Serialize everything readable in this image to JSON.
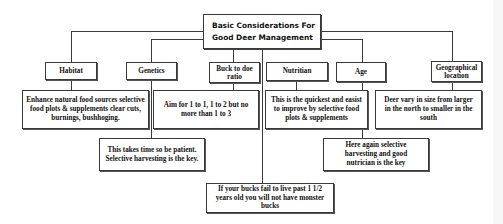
{
  "diagram": {
    "title": "Basic Considerations For Good Deer Management",
    "title_lines": [
      "Basic Considerations For",
      "Good Deer Management"
    ],
    "categories": [
      {
        "id": "habitat",
        "label": "Habitat"
      },
      {
        "id": "genetics",
        "label": "Genetics"
      },
      {
        "id": "buck-to-doe",
        "label": "Buck to doe ratio"
      },
      {
        "id": "nutrition",
        "label": "Nutritian"
      },
      {
        "id": "age",
        "label": "Age"
      },
      {
        "id": "geo",
        "label": "Geographical location"
      }
    ],
    "details": {
      "habitat": "Enhance natural food sources selective food plots & supplements clear cuts, burnings, bushhoging.",
      "buck_to_doe": "Aim for 1 to 1, 1 to 2 but no more than 1 to 3",
      "genetics": "This takes time so be patient. Selective harvesting is the key.",
      "nutrition": "This is the quickest and easist to improve by selective food plots & supplements",
      "age": "Here again selective harvesting and good nutrician is the key",
      "geo": "Deer vary in size from larger in the north to smaller in the south",
      "bottom": "If your bucks fail to live past 1 1/2 years old you will not have monster bucks"
    },
    "colors": {
      "line": "#3a3a3a",
      "background": "#ffffff",
      "text": "#111111"
    }
  }
}
